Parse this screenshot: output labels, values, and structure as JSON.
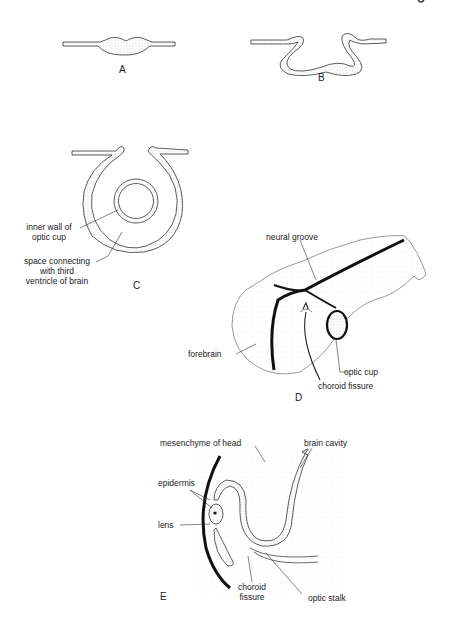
{
  "figure": {
    "corner_fragment": "g",
    "panels": [
      {
        "id": "A",
        "label": "A",
        "description": "Thickening of neural plate (optic placode)"
      },
      {
        "id": "B",
        "label": "B",
        "description": "Invagination forming groove"
      },
      {
        "id": "C",
        "label": "C",
        "annotations": [
          {
            "key": "inner_wall",
            "lines": [
              "inner wall of",
              "optic cup"
            ]
          },
          {
            "key": "space",
            "lines": [
              "space connecting",
              "with third",
              "ventricle of brain"
            ]
          }
        ]
      },
      {
        "id": "D",
        "label": "D",
        "annotations": [
          {
            "key": "neural_groove",
            "lines": [
              "neural groove"
            ]
          },
          {
            "key": "forebrain",
            "lines": [
              "forebrain"
            ]
          },
          {
            "key": "optic_cup",
            "lines": [
              "optic cup"
            ]
          },
          {
            "key": "choroid_fissure",
            "lines": [
              "choroid fissure"
            ]
          }
        ]
      },
      {
        "id": "E",
        "label": "E",
        "annotations": [
          {
            "key": "mesenchyme",
            "lines": [
              "mesenchyme of head"
            ]
          },
          {
            "key": "brain_cavity",
            "lines": [
              "brain cavity"
            ]
          },
          {
            "key": "epidermis",
            "lines": [
              "epidermis"
            ]
          },
          {
            "key": "lens",
            "lines": [
              "lens"
            ]
          },
          {
            "key": "choroid_fissure",
            "lines": [
              "choroid",
              "fissure"
            ]
          },
          {
            "key": "optic_stalk",
            "lines": [
              "optic stalk"
            ]
          }
        ]
      }
    ],
    "colors": {
      "line": "#222222",
      "stipple": "#bdbdbd",
      "background": "#ffffff"
    }
  }
}
